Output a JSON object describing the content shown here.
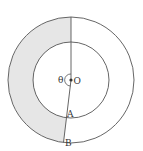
{
  "diagram": {
    "labels": {
      "theta": "θ",
      "center": "O",
      "point_a": "A",
      "point_b": "B"
    },
    "colors": {
      "stroke": "#555555",
      "shaded": "#e6e6e6"
    }
  }
}
